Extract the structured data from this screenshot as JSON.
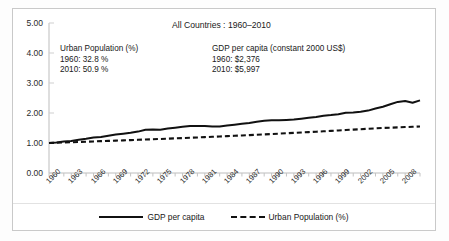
{
  "chart_data": {
    "type": "line",
    "title": "All Countries : 1960–2010",
    "xlabel": "",
    "ylabel": "",
    "ylim": [
      0.0,
      5.0
    ],
    "xlim": [
      1960,
      2010
    ],
    "ytick_labels": [
      "5.00",
      "4.00",
      "3.00",
      "2.00",
      "1.00",
      "0.00"
    ],
    "ytick_values": [
      5.0,
      4.0,
      3.0,
      2.0,
      1.0,
      0.0
    ],
    "xtick_labels": [
      "1960",
      "1963",
      "1966",
      "1969",
      "1972",
      "1975",
      "1978",
      "1981",
      "1984",
      "1987",
      "1990",
      "1993",
      "1996",
      "1999",
      "2002",
      "2005",
      "2008"
    ],
    "xtick_values": [
      1960,
      1963,
      1966,
      1969,
      1972,
      1975,
      1978,
      1981,
      1984,
      1987,
      1990,
      1993,
      1996,
      1999,
      2002,
      2005,
      2008
    ],
    "grid": false,
    "legend_position": "bottom",
    "x": [
      1960,
      1961,
      1962,
      1963,
      1964,
      1965,
      1966,
      1967,
      1968,
      1969,
      1970,
      1971,
      1972,
      1973,
      1974,
      1975,
      1976,
      1977,
      1978,
      1979,
      1980,
      1981,
      1982,
      1983,
      1984,
      1985,
      1986,
      1987,
      1988,
      1989,
      1990,
      1991,
      1992,
      1993,
      1994,
      1995,
      1996,
      1997,
      1998,
      1999,
      2000,
      2001,
      2002,
      2003,
      2004,
      2005,
      2006,
      2007,
      2008,
      2009,
      2010
    ],
    "series": [
      {
        "name": "GDP per capita",
        "style": "solid",
        "color": "#111111",
        "values": [
          1.0,
          1.02,
          1.05,
          1.07,
          1.11,
          1.14,
          1.18,
          1.2,
          1.24,
          1.28,
          1.31,
          1.34,
          1.38,
          1.44,
          1.45,
          1.44,
          1.48,
          1.51,
          1.54,
          1.57,
          1.57,
          1.57,
          1.55,
          1.55,
          1.58,
          1.61,
          1.64,
          1.67,
          1.71,
          1.74,
          1.76,
          1.76,
          1.77,
          1.78,
          1.81,
          1.84,
          1.87,
          1.91,
          1.93,
          1.96,
          2.01,
          2.02,
          2.04,
          2.08,
          2.15,
          2.21,
          2.29,
          2.37,
          2.4,
          2.34,
          2.42
        ]
      },
      {
        "name": "Urban Population (%)",
        "style": "dashed",
        "color": "#111111",
        "values": [
          1.0,
          1.008,
          1.017,
          1.025,
          1.034,
          1.043,
          1.052,
          1.061,
          1.07,
          1.079,
          1.088,
          1.097,
          1.106,
          1.116,
          1.125,
          1.135,
          1.145,
          1.155,
          1.165,
          1.175,
          1.185,
          1.196,
          1.207,
          1.218,
          1.229,
          1.24,
          1.251,
          1.263,
          1.275,
          1.287,
          1.299,
          1.311,
          1.324,
          1.337,
          1.35,
          1.363,
          1.376,
          1.39,
          1.404,
          1.418,
          1.432,
          1.446,
          1.46,
          1.474,
          1.488,
          1.502,
          1.511,
          1.521,
          1.531,
          1.541,
          1.552
        ]
      }
    ],
    "annotations": [
      {
        "name": "urban-population-annotation",
        "lines": [
          "Urban Population (%)",
          "1960: 32.8 %",
          "2010: 50.9 %"
        ]
      },
      {
        "name": "gdp-per-capita-annotation",
        "lines": [
          "GDP per capita  (constant 2000 US$)",
          "1960: $2,376",
          "2010: $5,997"
        ]
      }
    ]
  },
  "legend": {
    "items": [
      {
        "label": "GDP per capita",
        "style": "solid"
      },
      {
        "label": "Urban Population (%)",
        "style": "dashed"
      }
    ]
  }
}
